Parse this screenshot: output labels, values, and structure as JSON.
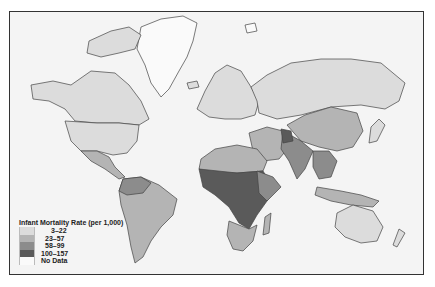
{
  "map": {
    "subject": "Infant Mortality Rate world choropleth",
    "projection": "Mercator-like world map",
    "legend": {
      "title": "Infant Mortality Rate (per 1,000)",
      "items": [
        {
          "label": "3–22",
          "color": "#dcdcdc"
        },
        {
          "label": "23–57",
          "color": "#b4b4b4"
        },
        {
          "label": "58–99",
          "color": "#8c8c8c"
        },
        {
          "label": "100–157",
          "color": "#5a5a5a"
        },
        {
          "label": "No Data",
          "color": "#fafafa"
        }
      ]
    },
    "colors": {
      "ocean": "#f4f4f4",
      "border": "#333333",
      "low": "#dcdcdc",
      "midlow": "#b4b4b4",
      "midhigh": "#8c8c8c",
      "high": "#5a5a5a"
    }
  }
}
